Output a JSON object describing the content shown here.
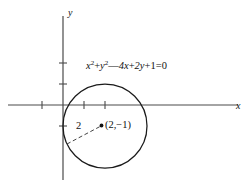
{
  "figure": {
    "type": "geometry-diagram",
    "background_color": "#ffffff",
    "stroke_color": "#1a1a1a",
    "axis_color": "#4a4a4a",
    "axes": {
      "x_label": "x",
      "y_label": "y",
      "origin_px": [
        63,
        105
      ],
      "unit_px": 21,
      "x_ticks": [
        -1,
        1,
        2
      ],
      "y_ticks": [
        -1,
        2,
        3
      ]
    },
    "equation": {
      "full_text": "x² + y² − 4x + 2y + 1 = 0",
      "term_x_squared_base": "x",
      "term_x_squared_exp": "2",
      "plus_1": "+",
      "term_y_squared_base": "y",
      "term_y_squared_exp": "2",
      "minus": "—",
      "term_4x": "4x",
      "plus_2": "+",
      "term_2y": "2y",
      "plus_3": "+",
      "term_const": "1",
      "equals": "=",
      "rhs": "0"
    },
    "circle": {
      "center_label": "(2,−1)",
      "center_value": [
        2,
        -1
      ],
      "radius_label": "2",
      "radius_value": 2,
      "center_px": [
        105,
        126
      ],
      "radius_px": 42
    },
    "radius_segment": {
      "from_px": [
        67,
        144
      ],
      "to_px": [
        101,
        126
      ],
      "style": "dashed"
    }
  }
}
